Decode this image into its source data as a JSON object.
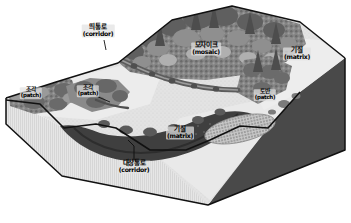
{
  "figure": {
    "width": 351,
    "height": 223
  },
  "colors": {
    "background": "#ffffff",
    "block_outline": "#000000",
    "matrix_light": "#e8e8e8",
    "matrix_mid": "#d2d2d2",
    "side_left": "#dcdcdc",
    "side_right": "#4a4a4a",
    "forest_dark": "#6d6d6d",
    "forest_mid": "#8e8e8e",
    "forest_light": "#b4b4b4",
    "water_dark": "#3d3d3d",
    "corridor_gray": "#7a7a7a",
    "label_bg": "#e2e2e2"
  },
  "labels": [
    {
      "id": "corridor-strip",
      "ko": "띄통로",
      "en": "(corridor)",
      "x": 98,
      "y": 31,
      "size": "normal"
    },
    {
      "id": "patch-left",
      "ko": "조각",
      "en": "(patch)",
      "x": 31,
      "y": 93,
      "size": "small"
    },
    {
      "id": "patch-mid",
      "ko": "조각",
      "en": "(patch)",
      "x": 88,
      "y": 91,
      "size": "small"
    },
    {
      "id": "mosaic",
      "ko": "모자이크",
      "en": "(mosaic)",
      "x": 206,
      "y": 49,
      "size": "normal"
    },
    {
      "id": "matrix-right",
      "ko": "기질",
      "en": "(matrix)",
      "x": 297,
      "y": 54,
      "size": "normal"
    },
    {
      "id": "patch-right",
      "ko": "토반",
      "en": "(patch)",
      "x": 265,
      "y": 95,
      "size": "small"
    },
    {
      "id": "matrix-lower",
      "ko": "기질",
      "en": "(matrix)",
      "x": 180,
      "y": 133,
      "size": "normal"
    },
    {
      "id": "corridor-river",
      "ko": "대상통로",
      "en": "(corridor)",
      "x": 134,
      "y": 167,
      "size": "normal"
    }
  ],
  "legend_terms": {
    "patch_ko": "조각",
    "patch_en": "patch",
    "corridor_ko": "통로",
    "corridor_en": "corridor",
    "matrix_ko": "기질",
    "matrix_en": "matrix",
    "mosaic_ko": "모자이크",
    "mosaic_en": "mosaic"
  }
}
